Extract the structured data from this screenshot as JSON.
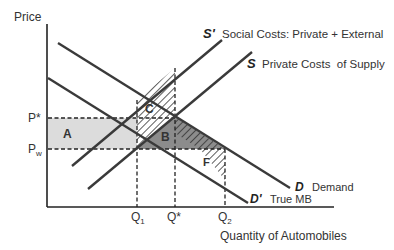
{
  "diagram": {
    "type": "supply-demand-externality",
    "axes": {
      "y_label": "Price",
      "x_label": "Quantity of Automobiles"
    },
    "price_ticks": [
      {
        "label": "P*",
        "sub": ""
      },
      {
        "label": "P",
        "sub": "w"
      }
    ],
    "quantity_ticks": [
      {
        "label": "Q",
        "sub": "1"
      },
      {
        "label": "Q*",
        "sub": ""
      },
      {
        "label": "Q",
        "sub": "2"
      }
    ],
    "curves": [
      {
        "id": "S_prime",
        "symbol": "S'",
        "description": "Social Costs: Private + External"
      },
      {
        "id": "S",
        "symbol": "S",
        "description": "Private Costs  of Supply"
      },
      {
        "id": "D",
        "symbol": "D",
        "description": "Demand"
      },
      {
        "id": "D_prime",
        "symbol": "D'",
        "description": "True MB"
      }
    ],
    "areas": [
      {
        "id": "A",
        "label": "A",
        "fill": "light gray"
      },
      {
        "id": "B",
        "label": "B",
        "fill": "dark gray"
      },
      {
        "id": "C",
        "label": "C",
        "fill": "hatched"
      },
      {
        "id": "F",
        "label": "F",
        "fill": "hatched"
      }
    ],
    "colors": {
      "line": "#3a3a3a",
      "area_a": "#dcdcdc",
      "area_b": "#8c8c8c",
      "hatch": "#333333"
    }
  }
}
